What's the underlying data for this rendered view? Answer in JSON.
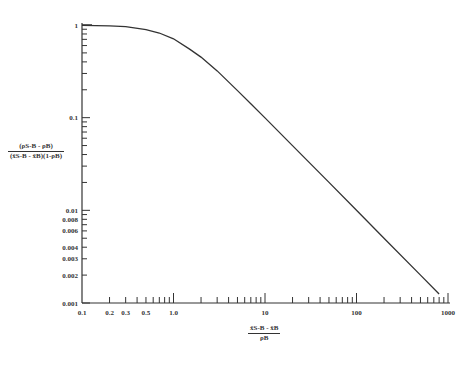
{
  "chart_data": {
    "type": "line",
    "title": "",
    "xscale": "log",
    "yscale": "log",
    "xlim": [
      0.1,
      1000
    ],
    "ylim": [
      0.001,
      1
    ],
    "grid": false,
    "legend": null,
    "xlabel": {
      "numerator": "x̄S-B - x̄B",
      "denominator": "ρB"
    },
    "ylabel": {
      "numerator": "(ρS-B - ρB)",
      "denominator": "(x̄S-B - x̄B)(1-ρB)"
    },
    "x_tick_labels": [
      "0.1",
      "0.2",
      "0.3",
      "0.5",
      "1.0",
      "10",
      "100",
      "1000"
    ],
    "y_tick_labels": [
      "1",
      "0.1",
      "0.01",
      "0.008",
      "0.006",
      "0.004",
      "0.003",
      "0.002",
      "0.001"
    ],
    "series": [
      {
        "name": "curve",
        "x": [
          0.1,
          0.2,
          0.3,
          0.5,
          0.7,
          1.0,
          1.5,
          2,
          3,
          5,
          7,
          10,
          20,
          50,
          100,
          200,
          500,
          800
        ],
        "y": [
          0.99,
          0.98,
          0.96,
          0.89,
          0.82,
          0.71,
          0.55,
          0.45,
          0.32,
          0.196,
          0.141,
          0.0995,
          0.05,
          0.02,
          0.01,
          0.005,
          0.002,
          0.00125
        ]
      }
    ]
  }
}
